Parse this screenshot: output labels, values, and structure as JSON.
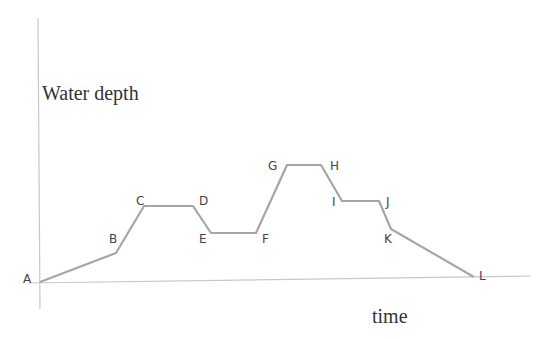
{
  "chart_data": {
    "type": "line",
    "title": "",
    "xlabel": "time",
    "ylabel": "Water depth",
    "grid": false,
    "legend": null,
    "points": [
      {
        "label": "A",
        "x": 40,
        "y": 282
      },
      {
        "label": "B",
        "x": 116,
        "y": 253
      },
      {
        "label": "C",
        "x": 144,
        "y": 206
      },
      {
        "label": "D",
        "x": 193,
        "y": 206
      },
      {
        "label": "E",
        "x": 211,
        "y": 233
      },
      {
        "label": "F",
        "x": 256,
        "y": 233
      },
      {
        "label": "G",
        "x": 287,
        "y": 165
      },
      {
        "label": "H",
        "x": 321,
        "y": 165
      },
      {
        "label": "I",
        "x": 342,
        "y": 201
      },
      {
        "label": "J",
        "x": 379,
        "y": 201
      },
      {
        "label": "K",
        "x": 391,
        "y": 229
      },
      {
        "label": "L",
        "x": 474,
        "y": 277
      }
    ],
    "relative_depth": {
      "A": 0,
      "B": 1.1,
      "C": 2.9,
      "D": 2.9,
      "E": 1.9,
      "F": 1.9,
      "G": 4.5,
      "H": 4.5,
      "I": 3.1,
      "J": 3.1,
      "K": 2.0,
      "L": 0
    }
  },
  "labels": {
    "y_axis": "Water depth",
    "x_axis": "time",
    "A": "A",
    "B": "B",
    "C": "C",
    "D": "D",
    "E": "E",
    "F": "F",
    "G": "G",
    "H": "H",
    "I": "I",
    "J": "J",
    "K": "K",
    "L": "L"
  }
}
